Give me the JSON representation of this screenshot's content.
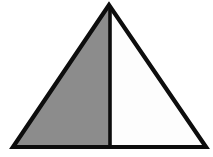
{
  "figure": {
    "canvas": {
      "width": 213,
      "height": 157,
      "background": "#ffffff"
    },
    "colors": {
      "outline": "#0d0d0d",
      "shaded_fill": "#8c8c8c",
      "unshaded_fill": "#fdfdfd",
      "background": "#ffffff"
    },
    "stroke": {
      "outline_width": 4.2,
      "divider_width": 3.6
    },
    "vertices": {
      "apex": {
        "x": 109,
        "y": 5
      },
      "bottom_left": {
        "x": 13,
        "y": 147
      },
      "bottom_right": {
        "x": 206,
        "y": 147
      },
      "base_midpoint": {
        "x": 110,
        "y": 147
      }
    },
    "regions": [
      {
        "name": "left-region",
        "label": "shaded left sub-triangle",
        "fill": "#8c8c8c",
        "points": "109,5 13,147 110,147"
      },
      {
        "name": "right-region",
        "label": "unshaded right sub-triangle",
        "fill": "#fdfdfd",
        "points": "109,5 110,147 206,147"
      }
    ],
    "outline_points": "109,5 13,147 206,147",
    "divider": {
      "name": "altitude",
      "x1": 110,
      "y1": 6,
      "x2": 110,
      "y2": 147
    }
  }
}
